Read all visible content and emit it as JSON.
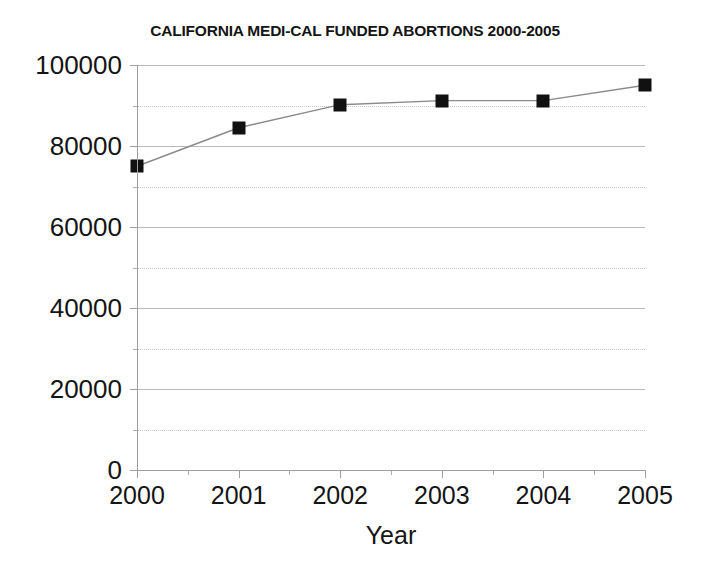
{
  "chart_data": {
    "type": "line",
    "title": "CALIFORNIA MEDI-CAL FUNDED ABORTIONS 2000-2005",
    "xlabel": "Year",
    "ylabel": "",
    "categories": [
      "2000",
      "2001",
      "2002",
      "2003",
      "2004",
      "2005"
    ],
    "x": [
      2000,
      2001,
      2002,
      2003,
      2004,
      2005
    ],
    "values": [
      75000,
      84500,
      90200,
      91200,
      91200,
      95000
    ],
    "series": [
      {
        "name": "Medi-Cal funded abortions",
        "values": [
          75000,
          84500,
          90200,
          91200,
          91200,
          95000
        ]
      }
    ],
    "xlim": [
      2000,
      2005
    ],
    "ylim": [
      0,
      100000
    ],
    "y_major_ticks": [
      0,
      20000,
      40000,
      60000,
      80000,
      100000
    ],
    "y_major_tick_labels": [
      "0",
      "20000",
      "40000",
      "60000",
      "80000",
      "100000"
    ],
    "y_minor_ticks": [
      10000,
      30000,
      50000,
      70000,
      90000
    ],
    "x_major_ticks": [
      2000,
      2001,
      2002,
      2003,
      2004,
      2005
    ],
    "x_minor_ticks": [
      2000.5,
      2001.5,
      2002.5,
      2003.5,
      2004.5
    ],
    "grid": {
      "major_horizontal": true,
      "minor_horizontal": true,
      "vertical": false,
      "major_style": "solid",
      "minor_style": "dotted"
    },
    "legend": {
      "visible": false,
      "position": "none"
    },
    "marker": "square",
    "colors": {
      "marker": "#111111",
      "line": "#8a8a8a",
      "grid_major": "#b9b9b9",
      "grid_minor": "#c9c9c9",
      "axis": "#9e9e9e",
      "text": "#141414",
      "background": "#ffffff"
    }
  }
}
